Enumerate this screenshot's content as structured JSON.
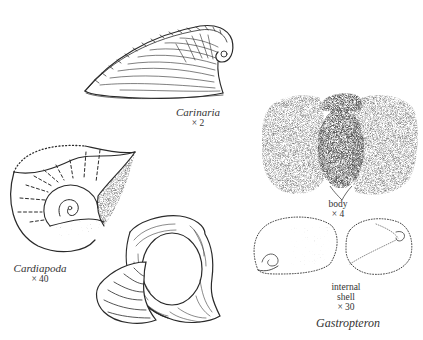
{
  "figure": {
    "specimens": [
      {
        "id": "carinaria",
        "name": "Carinaria",
        "magnification": "× 2",
        "view": "shell"
      },
      {
        "id": "cardiapoda",
        "name": "Cardiapoda",
        "magnification": "× 40",
        "view": "shell, two views"
      },
      {
        "id": "gastropteron",
        "name": "Gastropteron",
        "parts": [
          {
            "label": "body",
            "magnification": "× 4"
          },
          {
            "label_line1": "internal",
            "label_line2": "shell",
            "magnification": "× 30"
          }
        ]
      }
    ],
    "colors": {
      "ink": "#2a2a2a",
      "stipple": "#3a3a3a",
      "background": "#ffffff"
    }
  }
}
